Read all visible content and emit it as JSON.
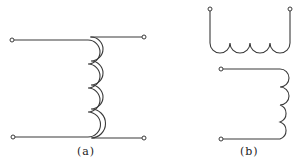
{
  "diagram": {
    "type": "inductor/transformer winding symbols",
    "figures": [
      {
        "id": "a",
        "label": "(a)",
        "description": "inductor with iron core (double-line coil, 4 loops) between two horizontal leads, 4 terminals"
      },
      {
        "id": "b",
        "label": "(b)",
        "description": "two coupled windings: upper winding with 4 downward loops, lower winding with 4 rightward loops"
      }
    ],
    "colors": {
      "line": "#3a3a3a",
      "background": "#ffffff"
    }
  }
}
